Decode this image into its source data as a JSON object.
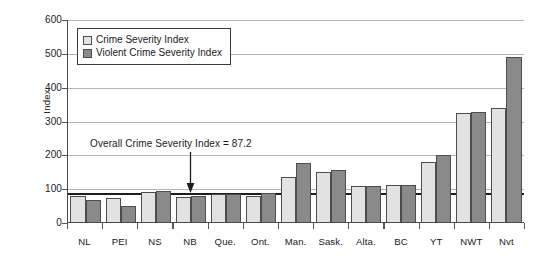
{
  "chart_data": {
    "type": "bar",
    "title": "",
    "xlabel": "",
    "ylabel": "Index",
    "ylim": [
      0,
      600
    ],
    "yticks": [
      0,
      100,
      200,
      300,
      400,
      500,
      600
    ],
    "grid": true,
    "legend_position": "top-left",
    "categories": [
      "NL",
      "PEI",
      "NS",
      "NB",
      "Que.",
      "Ont.",
      "Man.",
      "Sask.",
      "Alta.",
      "BC",
      "YT",
      "NWT",
      "Nvt"
    ],
    "series": [
      {
        "name": "Crime Severity Index",
        "color": "#e2e2e2",
        "values": [
          77,
          70,
          90,
          74,
          83,
          78,
          133,
          148,
          106,
          109,
          178,
          322,
          336
        ]
      },
      {
        "name": "Violent Crime Severity Index",
        "color": "#8a8a8a",
        "values": [
          66,
          48,
          93,
          76,
          82,
          87,
          175,
          154,
          106,
          110,
          197,
          324,
          489
        ]
      }
    ],
    "annotations": [
      {
        "text": "Overall Crime Severity Index = 87.2",
        "value": 87.2,
        "type": "reference-line-with-arrow"
      }
    ]
  },
  "legend": {
    "items": [
      {
        "label": "Crime Severity Index",
        "swatch": "light-grey-square-icon"
      },
      {
        "label": "Violent Crime Severity Index",
        "swatch": "dark-grey-square-icon"
      }
    ]
  },
  "axes": {
    "y_title": "Index",
    "y_tick_labels": [
      "600",
      "500",
      "400",
      "300",
      "200",
      "100",
      "0"
    ],
    "x_tick_labels": [
      "NL",
      "PEI",
      "NS",
      "NB",
      "Que.",
      "Ont.",
      "Man.",
      "Sask.",
      "Alta.",
      "BC",
      "YT",
      "NWT",
      "Nvt"
    ]
  },
  "annotation": {
    "text": "Overall Crime Severity Index = 87.2"
  }
}
